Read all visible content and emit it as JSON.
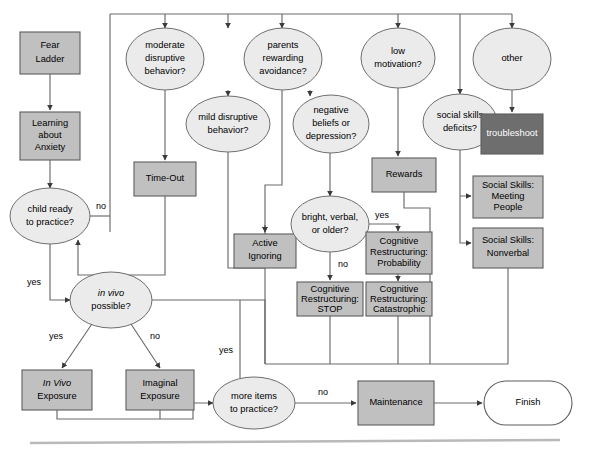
{
  "figure": {
    "kind": "treatment-decision-flowchart",
    "colors": {
      "process_fill": "#c0c0c0",
      "process_stroke": "#5d5d5d",
      "decision_fill": "#ebebeb",
      "decision_stroke": "#6e6e6e",
      "terminator_fill": "#ffffff",
      "troubleshoot_fill": "#6e6e6e",
      "troubleshoot_text": "#ffffff",
      "connector": "#6a6a6a",
      "footer_rule": "#b9b9b9",
      "background": "#ffffff"
    }
  },
  "nodes": {
    "fear_ladder": {
      "label_lines": [
        "Fear",
        "Ladder"
      ],
      "shape": "process"
    },
    "learning_anxiety": {
      "label_lines": [
        "Learning",
        "about",
        "Anxiety"
      ],
      "shape": "process"
    },
    "child_ready": {
      "label_lines": [
        "child ready",
        "to practice?"
      ],
      "shape": "decision"
    },
    "in_vivo_possible": {
      "label_lines": [
        "in vivo",
        "possible?"
      ],
      "shape": "decision",
      "italic_lines": [
        0
      ]
    },
    "in_vivo_exposure": {
      "label_lines": [
        "In Vivo",
        "Exposure"
      ],
      "shape": "process",
      "italic_lines": [
        0
      ]
    },
    "imaginal_exposure": {
      "label_lines": [
        "Imaginal",
        "Exposure"
      ],
      "shape": "process"
    },
    "more_items": {
      "label_lines": [
        "more items",
        "to practice?"
      ],
      "shape": "decision"
    },
    "maintenance": {
      "label_lines": [
        "Maintenance"
      ],
      "shape": "process"
    },
    "finish": {
      "label_lines": [
        "Finish"
      ],
      "shape": "terminator"
    },
    "moderate_disruptive": {
      "label_lines": [
        "moderate",
        "disruptive",
        "behavior?"
      ],
      "shape": "decision"
    },
    "mild_disruptive": {
      "label_lines": [
        "mild disruptive",
        "behavior?"
      ],
      "shape": "decision"
    },
    "time_out": {
      "label_lines": [
        "Time-Out"
      ],
      "shape": "process"
    },
    "active_ignoring": {
      "label_lines": [
        "Active",
        "Ignoring"
      ],
      "shape": "process"
    },
    "parents_rewarding": {
      "label_lines": [
        "parents",
        "rewarding",
        "avoidance?"
      ],
      "shape": "decision"
    },
    "negative_beliefs": {
      "label_lines": [
        "negative",
        "beliefs or",
        "depression?"
      ],
      "shape": "decision"
    },
    "bright_verbal": {
      "label_lines": [
        "bright, verbal,",
        "or older?"
      ],
      "shape": "decision"
    },
    "cr_stop": {
      "label_lines": [
        "Cognitive",
        "Restructuring:",
        "STOP"
      ],
      "shape": "process"
    },
    "cr_probability": {
      "label_lines": [
        "Cognitive",
        "Restructuring:",
        "Probability"
      ],
      "shape": "process"
    },
    "cr_catastrophic": {
      "label_lines": [
        "Cognitive",
        "Restructuring:",
        "Catastrophic"
      ],
      "shape": "process"
    },
    "low_motivation": {
      "label_lines": [
        "low",
        "motivation?"
      ],
      "shape": "decision"
    },
    "rewards": {
      "label_lines": [
        "Rewards"
      ],
      "shape": "process"
    },
    "social_skills_deficits": {
      "label_lines": [
        "social skills",
        "deficits?"
      ],
      "shape": "decision"
    },
    "ss_meeting_people": {
      "label_lines": [
        "Social Skills:",
        "Meeting",
        "People"
      ],
      "shape": "process"
    },
    "ss_nonverbal": {
      "label_lines": [
        "Social Skills:",
        "Nonverbal"
      ],
      "shape": "process"
    },
    "other": {
      "label_lines": [
        "other"
      ],
      "shape": "decision"
    },
    "troubleshoot": {
      "label_lines": [
        "troubleshoot"
      ],
      "shape": "process-dark"
    }
  },
  "edge_labels": {
    "child_ready_no": "no",
    "child_ready_yes": "yes",
    "in_vivo_yes": "yes",
    "in_vivo_no": "no",
    "more_items_yes": "yes",
    "more_items_no": "no",
    "bright_yes": "yes",
    "bright_no": "no"
  }
}
